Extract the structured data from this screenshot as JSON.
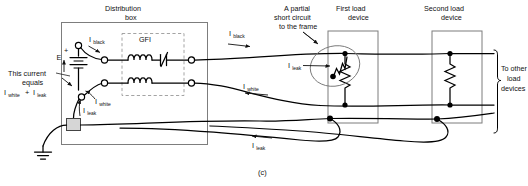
{
  "figure": {
    "caption": "(c)",
    "type": "circuit-diagram"
  },
  "labels": {
    "distribution_box_line1": "Distribution",
    "distribution_box_line2": "box",
    "gfi": "GFI",
    "source_label": "E",
    "source_polarity_plus": "+",
    "source_polarity_minus": "−",
    "note_line1": "This current",
    "note_line2": "equals",
    "short_circuit_line1": "A partial",
    "short_circuit_line2": "short circuit",
    "short_circuit_line3": "to the frame",
    "first_load_line1": "First load",
    "first_load_line2": "device",
    "second_load_line1": "Second load",
    "second_load_line2": "device",
    "to_other_line1": "To other",
    "to_other_line2": "load",
    "to_other_line3": "devices"
  },
  "currents": {
    "symbol": "I",
    "black": "black",
    "white": "white",
    "leak": "leak",
    "plus_sign": "+",
    "i_black_inside": "I",
    "i_black_inside_sub": "black",
    "i_black_outside": "I",
    "i_black_outside_sub": "black",
    "i_white_inside": "I",
    "i_white_inside_sub": "white",
    "i_white_outside": "I",
    "i_white_outside_sub": "white",
    "i_leak_box": "I",
    "i_leak_box_sub": "leak",
    "i_leak_load": "I",
    "i_leak_load_sub": "leak",
    "i_leak_return": "I",
    "i_leak_return_sub": "leak",
    "equation_first": "I",
    "equation_first_sub": "white",
    "equation_second": "I",
    "equation_second_sub": "leak"
  },
  "colors": {
    "wire": "#000000",
    "enclosure": "#7d7d7d",
    "dashed_gfi": "#9a9a9a",
    "ground_block_fill": "#d6d6d6",
    "background": "#ffffff"
  }
}
